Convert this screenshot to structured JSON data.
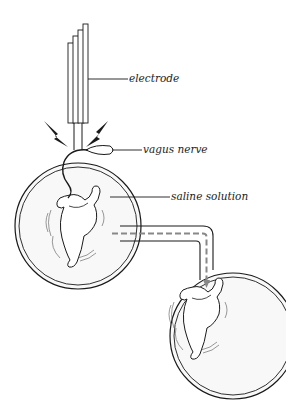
{
  "diagram": {
    "type": "experiment-illustration",
    "labels": {
      "electrode": "electrode",
      "vagus_nerve": "vagus nerve",
      "saline_solution": "saline solution"
    },
    "components": [
      {
        "id": "electrode",
        "description": "multi-prong stimulating electrode above first heart"
      },
      {
        "id": "lightning-bolts",
        "description": "two electrical stimulation bolts"
      },
      {
        "id": "vagus-nerve",
        "description": "nerve attached to first heart"
      },
      {
        "id": "dish-1",
        "description": "circular dish with saline solution and first heart"
      },
      {
        "id": "transfer-tube",
        "description": "tube with dashed flow line and arrow from dish 1 to dish 2"
      },
      {
        "id": "dish-2",
        "description": "circular dish with second heart receiving fluid"
      }
    ],
    "colors": {
      "stroke": "#1a1a1a",
      "background": "#ffffff",
      "dish_fill": "#f7f7f7",
      "tube_dash": "#888888"
    }
  }
}
